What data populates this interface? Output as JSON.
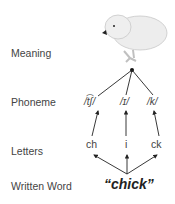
{
  "rows": {
    "meaning": "Meaning",
    "phoneme": "Phoneme",
    "letters": "Letters",
    "written_word": "Written Word"
  },
  "phonemes": [
    "/t͡ʃ/",
    "/ɪ/",
    "/k/"
  ],
  "letters": [
    "ch",
    "i",
    "ck"
  ],
  "word": "“chick”",
  "meaning_image": "chick-illustration"
}
